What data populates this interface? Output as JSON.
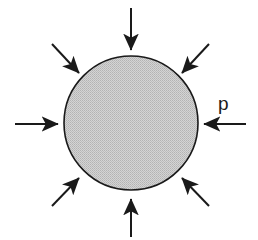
{
  "figure": {
    "background_color": "#ffffff",
    "width": 258,
    "height": 240
  },
  "sphere": {
    "name": "shaded-circle",
    "center_x": 131,
    "center_y": 123,
    "radius": 67,
    "fill_color": "#c9c9c9",
    "stroke_color": "#1a1a1a",
    "stroke_width": 1.6,
    "fill_pattern": "halftone-dither"
  },
  "labels": {
    "pressure": "p"
  },
  "label_positions": {
    "pressure_x": 218,
    "pressure_y": 110
  },
  "arrows": {
    "stroke_color": "#1a1a1a",
    "stroke_width": 2.0,
    "head_length": 13,
    "head_width": 7,
    "count": 8,
    "direction": "inward",
    "items": [
      {
        "name": "arrow-north",
        "label": "top",
        "x1": 131,
        "y1": 8,
        "x2": 131,
        "y2": 50
      },
      {
        "name": "arrow-northeast",
        "label": "upper-right",
        "x1": 209,
        "y1": 44,
        "x2": 182,
        "y2": 73
      },
      {
        "name": "arrow-east",
        "label": "right",
        "x1": 246,
        "y1": 124,
        "x2": 204,
        "y2": 124
      },
      {
        "name": "arrow-southeast",
        "label": "lower-right",
        "x1": 209,
        "y1": 206,
        "x2": 182,
        "y2": 178
      },
      {
        "name": "arrow-south",
        "label": "bottom",
        "x1": 131,
        "y1": 237,
        "x2": 131,
        "y2": 199
      },
      {
        "name": "arrow-southwest",
        "label": "lower-left",
        "x1": 52,
        "y1": 206,
        "x2": 79,
        "y2": 178
      },
      {
        "name": "arrow-west",
        "label": "left",
        "x1": 15,
        "y1": 124,
        "x2": 58,
        "y2": 124
      },
      {
        "name": "arrow-northwest",
        "label": "upper-left",
        "x1": 52,
        "y1": 44,
        "x2": 79,
        "y2": 73
      }
    ]
  }
}
